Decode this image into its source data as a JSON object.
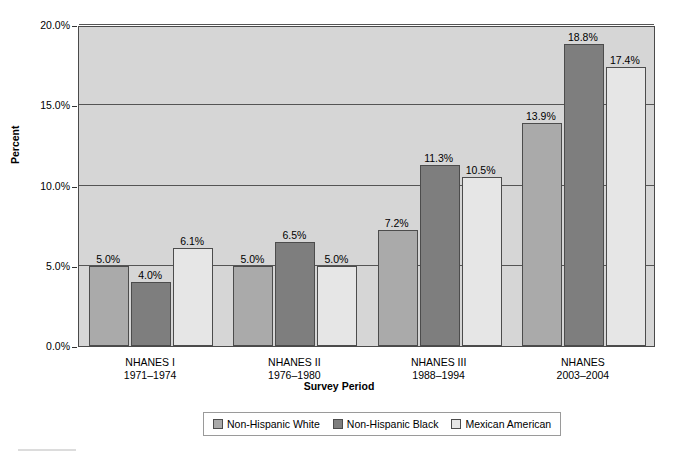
{
  "chart_data": {
    "type": "bar",
    "title": "",
    "xlabel": "Survey Period",
    "ylabel": "Percent",
    "ylim": [
      0,
      20
    ],
    "ytick_labels": [
      "0.0%",
      "5.0%",
      "10.0%",
      "15.0%",
      "20.0%"
    ],
    "yticks": [
      0,
      5,
      10,
      15,
      20
    ],
    "grid": true,
    "legend_position": "bottom",
    "categories": [
      "NHANES I\n1971–1974",
      "NHANES II\n1976–1980",
      "NHANES III\n1988–1994",
      "NHANES\n2003–2004"
    ],
    "category_lines": [
      [
        "NHANES I",
        "1971–1974"
      ],
      [
        "NHANES II",
        "1976–1980"
      ],
      [
        "NHANES III",
        "1988–1994"
      ],
      [
        "NHANES",
        "2003–2004"
      ]
    ],
    "series": [
      {
        "name": "Non-Hispanic White",
        "color": "#aaaaaa",
        "values": [
          5.0,
          5.0,
          7.2,
          13.9
        ],
        "labels": [
          "5.0%",
          "5.0%",
          "7.2%",
          "13.9%"
        ]
      },
      {
        "name": "Non-Hispanic Black",
        "color": "#7e7e7e",
        "values": [
          4.0,
          6.5,
          11.3,
          18.8
        ],
        "labels": [
          "4.0%",
          "6.5%",
          "11.3%",
          "18.8%"
        ]
      },
      {
        "name": "Mexican American",
        "color": "#e6e6e6",
        "values": [
          6.1,
          5.0,
          10.5,
          17.4
        ],
        "labels": [
          "6.1%",
          "5.0%",
          "10.5%",
          "17.4%"
        ]
      }
    ]
  },
  "colors": {
    "plot_background": "#d6d6d6",
    "axis": "#4a4a4a",
    "gridline": "#555555",
    "bar_border": "#4c4c4c",
    "legend_border": "#9a9a9a"
  }
}
